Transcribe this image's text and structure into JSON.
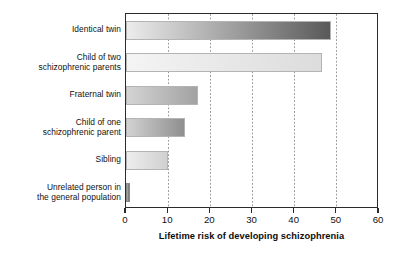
{
  "chart_data": {
    "type": "bar",
    "orientation": "horizontal",
    "title": "",
    "xlabel": "Lifetime risk of developing schizophrenia",
    "ylabel": "",
    "xlim": [
      0,
      60
    ],
    "xticks": [
      0,
      10,
      20,
      30,
      40,
      50,
      60
    ],
    "xtick_labels": [
      "0",
      "10",
      "20",
      "30",
      "40",
      "50",
      "60"
    ],
    "grid": "vertical-dotted",
    "legend": "none",
    "categories": [
      "Identical twin",
      "Child of two\nschizophrenic parents",
      "Fraternal twin",
      "Child of one\nschizophrenic parent",
      "Sibling",
      "Unrelated person in\nthe general population"
    ],
    "values": [
      48.5,
      46.5,
      17,
      14,
      10,
      1
    ],
    "bars": [
      {
        "label": "Identical twin",
        "value": 48.5,
        "gradient_start": "#ececed",
        "gradient_end": "#595959"
      },
      {
        "label": "Child of two schizophrenic parents",
        "value": 46.5,
        "gradient_start": "#f4f4f5",
        "gradient_end": "#dcdcdd"
      },
      {
        "label": "Fraternal twin",
        "value": 17,
        "gradient_start": "#d4d4d5",
        "gradient_end": "#a2a2a3"
      },
      {
        "label": "Child of one schizophrenic parent",
        "value": 14,
        "gradient_start": "#d2d2d3",
        "gradient_end": "#8f8f90"
      },
      {
        "label": "Sibling",
        "value": 10,
        "gradient_start": "#ededee",
        "gradient_end": "#d0d0d1"
      },
      {
        "label": "Unrelated person in the general population",
        "value": 1,
        "gradient_start": "#b0b0b1",
        "gradient_end": "#6e6e6f"
      }
    ],
    "colors": {
      "axis": "#2b2b2b",
      "gridline": "#9a9a9a",
      "text": "#111111",
      "background": "#ffffff"
    }
  }
}
